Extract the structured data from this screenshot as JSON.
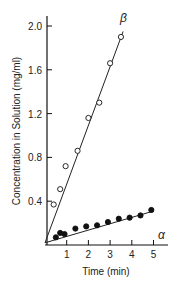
{
  "chart_data": {
    "type": "scatter",
    "title": "",
    "xlabel": "Time (min)",
    "ylabel": "Concentration in Solution (mg/ml)",
    "xlim": [
      0,
      5.6
    ],
    "ylim": [
      0,
      2.05
    ],
    "x_ticks": [
      1,
      2,
      3,
      4,
      5
    ],
    "y_ticks": [
      0.4,
      0.8,
      1.2,
      1.6,
      2.0
    ],
    "x_tick_labels": [
      "1",
      "2",
      "3",
      "4",
      "5"
    ],
    "y_tick_labels": [
      "0.4",
      "0.8",
      "1.2",
      "1.6",
      "2.0"
    ],
    "grid": false,
    "legend": "inline labels at line ends",
    "series": [
      {
        "name": "β",
        "marker": "open circle",
        "x": [
          0.4,
          0.7,
          0.95,
          1.5,
          2.0,
          2.5,
          3.0,
          3.5
        ],
        "y": [
          0.37,
          0.51,
          0.72,
          0.86,
          1.16,
          1.3,
          1.66,
          1.9
        ],
        "fit_line": {
          "x": [
            0,
            3.6
          ],
          "y": [
            0.02,
            1.95
          ]
        }
      },
      {
        "name": "α",
        "marker": "filled circle",
        "x": [
          0.5,
          0.7,
          0.9,
          1.4,
          1.9,
          2.4,
          2.9,
          3.4,
          3.9,
          4.4,
          4.9
        ],
        "y": [
          0.07,
          0.11,
          0.1,
          0.15,
          0.17,
          0.18,
          0.21,
          0.24,
          0.25,
          0.27,
          0.32
        ],
        "fit_line": {
          "x": [
            0,
            5.0
          ],
          "y": [
            0.02,
            0.31
          ]
        }
      }
    ]
  }
}
